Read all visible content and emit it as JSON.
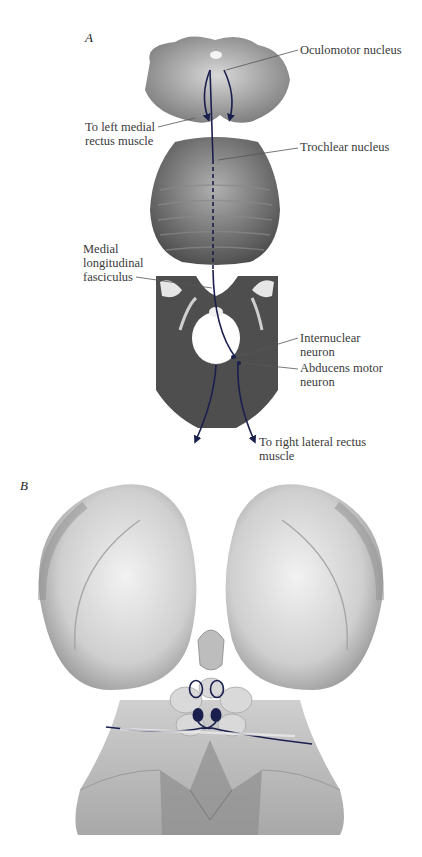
{
  "figure": {
    "panel_a": {
      "letter": "A",
      "labels": {
        "oculomotor": "Oculomotor nucleus",
        "left_medial_rectus_1": "To left medial",
        "left_medial_rectus_2": "rectus muscle",
        "trochlear": "Trochlear nucleus",
        "mlf_1": "Medial",
        "mlf_2": "longitudinal",
        "mlf_3": "fasciculus",
        "internuclear_1": "Internuclear",
        "internuclear_2": "neuron",
        "abducens_1": "Abducens motor",
        "abducens_2": "neuron",
        "right_lateral_1": "To right lateral rectus",
        "right_lateral_2": "muscle"
      }
    },
    "panel_b": {
      "letter": "B"
    },
    "colors": {
      "pathway": "#1a1f4d",
      "label_text": "#3a3a3a",
      "leader_line": "#555555",
      "tissue_dark": "#5a5a5a",
      "tissue_light": "#bdbdbd",
      "brainstem_surface": "#d4d4d4"
    }
  }
}
